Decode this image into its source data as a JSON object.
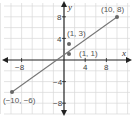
{
  "chart_data": {
    "type": "line",
    "title": "",
    "xlabel": "x",
    "ylabel": "y",
    "xlim": [
      -12,
      12
    ],
    "ylim": [
      -10,
      10
    ],
    "grid": true,
    "grid_step": 2,
    "x_ticks": [
      -8,
      4,
      8
    ],
    "y_ticks": [
      8,
      4,
      -4,
      -8
    ],
    "x_tick_labels": [
      "−8",
      "4",
      "8"
    ],
    "y_tick_labels": [
      "8",
      "4",
      "−4",
      "−8"
    ],
    "series": [
      {
        "name": "segment 1",
        "points": [
          {
            "x": -10,
            "y": -6
          },
          {
            "x": 10,
            "y": 8
          }
        ],
        "labels": [
          "(−10, −6)",
          "(10, 8)"
        ]
      }
    ],
    "points": [
      {
        "x": 1,
        "y": 3,
        "label": "(1, 3)"
      },
      {
        "x": 1,
        "y": 1,
        "label": "(1, 1)"
      }
    ],
    "annotations": [
      "(10, 8)",
      "(1, 3)",
      "(1, 1)",
      "(−10, −6)"
    ]
  },
  "labels": {
    "x_axis": "x",
    "y_axis": "y",
    "p_10_8": "(10, 8)",
    "p_1_3": "(1, 3)",
    "p_1_1": "(1, 1)",
    "p_m10_m6": "(−10, −6)",
    "tick_x_m8": "−8",
    "tick_x_4": "4",
    "tick_x_8": "8",
    "tick_y_8": "8",
    "tick_y_4": "4",
    "tick_y_m4": "−4",
    "tick_y_m8": "−8"
  },
  "colors": {
    "grid": "#d9d9d9",
    "axis": "#222222",
    "line": "#777777",
    "point": "#666666"
  }
}
